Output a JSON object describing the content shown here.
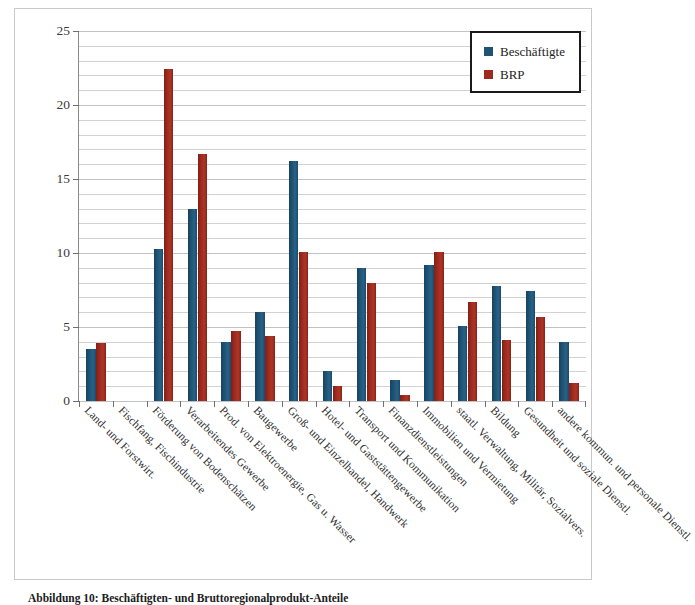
{
  "chart_data": {
    "type": "bar",
    "title": "",
    "xlabel": "",
    "ylabel": "",
    "ylim": [
      0,
      25
    ],
    "ytick_values": [
      0,
      5,
      10,
      15,
      20,
      25
    ],
    "ytick_labels": [
      "0",
      "5",
      "10",
      "15",
      "20",
      "25"
    ],
    "minor_gridline_step": 1,
    "grid": true,
    "legend_position": "top-right",
    "categories": [
      "Land- und Forstwirt.",
      "Fischfang, Fischindustrie",
      "Förderung von Bodenschätzen",
      "Verarbeitendes Gewerbe",
      "Prod. von Elektroenergie, Gas u. Wasser",
      "Baugewerbe",
      "Groß- und Einzelhandel, Handwerk",
      "Hotel- und Gaststättengewerbe",
      "Transport und Kommunikation",
      "Finanzdienstleistungen",
      "Immobilien und Vermietung",
      "staatl. Verwaltung, Militär, Sozialvers.",
      "Bildung",
      "Gesundheit und soziale Dienstl.",
      "andere kommun. und personale Dienstl."
    ],
    "series": [
      {
        "name": "Beschäftigte",
        "color": "#1f5373",
        "values": [
          3.5,
          0.0,
          10.3,
          13.0,
          4.0,
          6.0,
          16.2,
          2.0,
          9.0,
          1.4,
          9.2,
          5.1,
          7.8,
          7.4,
          4.0
        ]
      },
      {
        "name": "BRP",
        "color": "#9e2a1e",
        "values": [
          3.9,
          0.0,
          22.4,
          16.7,
          4.7,
          4.4,
          10.1,
          1.0,
          8.0,
          0.4,
          10.1,
          6.7,
          4.1,
          5.7,
          1.2
        ]
      }
    ]
  },
  "legend": {
    "items": [
      {
        "label": "Beschäftigte",
        "color": "#1f5373"
      },
      {
        "label": "BRP",
        "color": "#9e2a1e"
      }
    ]
  },
  "caption": {
    "text": "Abbildung 10: Beschäftigten- und Bruttoregionalprodukt-Anteile"
  }
}
